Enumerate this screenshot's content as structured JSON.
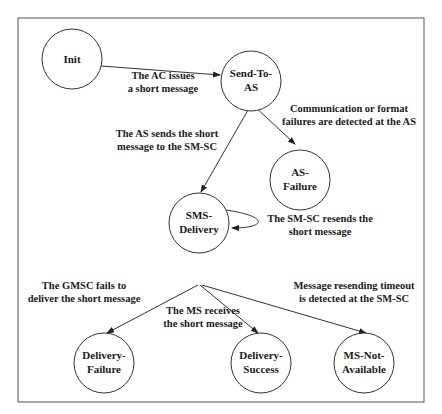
{
  "diagram": {
    "type": "state-transition",
    "frame": {
      "x": 18,
      "y": 18,
      "w": 406,
      "h": 384
    },
    "colors": {
      "stroke": "#333333",
      "text": "#1a1a1a",
      "background": "#ffffff"
    },
    "states": [
      {
        "id": "init",
        "lines": [
          "Init"
        ],
        "cx": 72,
        "cy": 59,
        "r": 30
      },
      {
        "id": "send-to-as",
        "lines": [
          "Send-To-",
          "AS"
        ],
        "cx": 251,
        "cy": 81,
        "r": 30
      },
      {
        "id": "as-failure",
        "lines": [
          "AS-",
          "Failure"
        ],
        "cx": 300,
        "cy": 180,
        "r": 30
      },
      {
        "id": "sms-delivery",
        "lines": [
          "SMS-",
          "Delivery"
        ],
        "cx": 199,
        "cy": 256,
        "r": 30
      },
      {
        "id": "delivery-failure",
        "lines": [
          "Delivery-",
          "Failure"
        ],
        "cx": 104,
        "cy": 372,
        "r": 30
      },
      {
        "id": "delivery-success",
        "lines": [
          "Delivery-",
          "Success"
        ],
        "cx": 261,
        "cy": 372,
        "r": 30
      },
      {
        "id": "ms-not-available",
        "lines": [
          "MS-Not-",
          "Available"
        ],
        "cx": 364,
        "cy": 372,
        "r": 30
      }
    ],
    "transitions": [
      {
        "from": "init",
        "to": "send-to-as",
        "label": [
          "The AC issues",
          "a short message"
        ]
      },
      {
        "from": "send-to-as",
        "to": "as-failure",
        "label": [
          "Communication or format",
          "failures are detected at the AS"
        ]
      },
      {
        "from": "send-to-as",
        "to": "sms-delivery",
        "label": [
          "The AS sends the short",
          "message to the SM-SC"
        ]
      },
      {
        "from": "sms-delivery",
        "to": "sms-delivery",
        "label": [
          "The SM-SC resends the",
          "short message"
        ]
      },
      {
        "from": "sms-delivery",
        "to": "delivery-failure",
        "label": [
          "The GMSC fails to",
          "deliver the short message"
        ]
      },
      {
        "from": "sms-delivery",
        "to": "delivery-success",
        "label": [
          "The MS receives",
          "the short message"
        ]
      },
      {
        "from": "sms-delivery",
        "to": "ms-not-available",
        "label": [
          "Message resending timeout",
          "is detected at the SM-SC"
        ]
      }
    ]
  }
}
